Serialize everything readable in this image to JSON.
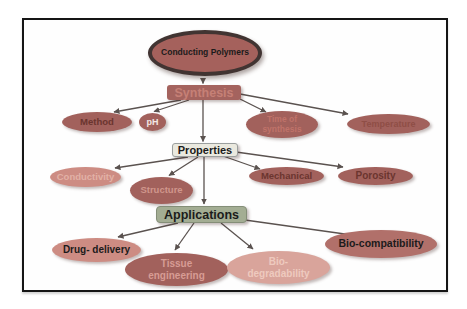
{
  "figure": {
    "type": "concept-map",
    "root": {
      "label": "Conducting Polymers"
    },
    "levels": [
      {
        "hub": {
          "label": "Synthesis"
        },
        "children": [
          {
            "label": "Method"
          },
          {
            "label": "pH"
          },
          {
            "label": "Time of synthesis"
          },
          {
            "label": "Temperature"
          }
        ]
      },
      {
        "hub": {
          "label": "Properties"
        },
        "children": [
          {
            "label": "Conductivity"
          },
          {
            "label": "Structure"
          },
          {
            "label": "Mechanical"
          },
          {
            "label": "Porosity"
          }
        ]
      },
      {
        "hub": {
          "label": "Applications"
        },
        "children": [
          {
            "label": "Drug- delivery"
          },
          {
            "label": "Tissue engineering"
          },
          {
            "label": "Bio-degradability"
          },
          {
            "label": "Bio-compatibility"
          }
        ]
      }
    ],
    "colors": {
      "frame_border": "#151515",
      "arrow": "#5a524f",
      "root_fill": "#a5615c",
      "root_ring": "#413432",
      "bg_brick": "#a2615c",
      "bg_salmon": "#cd8c83",
      "bg_lsalmon": "#d9a49b",
      "bg_mid": "#b1706a",
      "hub_syn_bg": "#a4635e",
      "hub_syn_txt": "#c68076",
      "hub_prop_bg": "#eae9df",
      "hub_prop_border": "#9b9f9e",
      "hub_app_bg": "#a3ad93",
      "hub_app_border": "#848e78",
      "txt_black": "#1b1b1b",
      "txt_maroon": "#6b352f",
      "txt_white": "#f2e7e4",
      "txt_coral": "#c0736a",
      "txt_rust": "#8f4e46",
      "txt_pink": "#d79c94",
      "txt_blush": "#e2b1a6",
      "txt_rose": "#d0968c",
      "txt_palepink": "#eecabf"
    }
  }
}
